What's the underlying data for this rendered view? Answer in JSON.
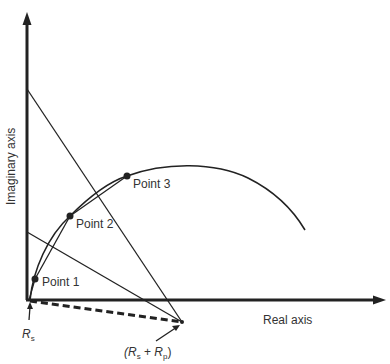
{
  "diagram": {
    "type": "impedance-plane-arc",
    "axes": {
      "x_label": "Real axis",
      "y_label": "Imaginary axis"
    },
    "points": [
      {
        "label": "Point 1",
        "x": 35,
        "y": 279
      },
      {
        "label": "Point 2",
        "x": 70,
        "y": 216
      },
      {
        "label": "Point 3",
        "x": 127,
        "y": 176
      }
    ],
    "annotations": {
      "rs_main": "R",
      "rs_sub": "s",
      "rsp_open": "(",
      "rsp_r1": "R",
      "rsp_s": "s",
      "rsp_plus": " + ",
      "rsp_r2": "R",
      "rsp_p": "p",
      "rsp_close": ")"
    },
    "colors": {
      "line": "#222222",
      "text": "#333333",
      "background": "#ffffff"
    }
  }
}
